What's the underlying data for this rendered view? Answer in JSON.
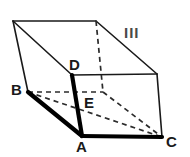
{
  "figure": {
    "kind": "geometry-diagram",
    "shape_name": "oblique prism",
    "region_label": "III",
    "stroke_color": "#1a1a1a",
    "thick_stroke_color": "#000000",
    "dashed_stroke_color": "#2b2b2b",
    "background_color": "#ffffff",
    "vertex_labels": [
      {
        "name": "label-B",
        "text": "B",
        "x": 11,
        "y": 82
      },
      {
        "name": "label-D",
        "text": "D",
        "x": 69,
        "y": 57
      },
      {
        "name": "label-E",
        "text": "E",
        "x": 84,
        "y": 95
      },
      {
        "name": "label-A",
        "text": "A",
        "x": 76,
        "y": 139
      },
      {
        "name": "label-C",
        "text": "C",
        "x": 166,
        "y": 134
      }
    ],
    "region_label_pos": {
      "x": 124,
      "y": 25
    },
    "points": {
      "top_back_left": {
        "x": 13,
        "y": 21
      },
      "top_back_right": {
        "x": 96,
        "y": 21
      },
      "top_front_right": {
        "x": 157,
        "y": 74
      },
      "D": {
        "x": 72,
        "y": 75
      },
      "B": {
        "x": 28,
        "y": 92
      },
      "E": {
        "x": 103,
        "y": 92
      },
      "A": {
        "x": 82,
        "y": 136
      },
      "C": {
        "x": 162,
        "y": 137
      }
    },
    "solid_edges": [
      {
        "name": "edge-topback-top",
        "from": "top_back_left",
        "to": "top_back_right"
      },
      {
        "name": "edge-topbackright-topfrontright",
        "from": "top_back_right",
        "to": "top_front_right"
      },
      {
        "name": "edge-topbackleft-D",
        "from": "top_back_left",
        "to": "D"
      },
      {
        "name": "edge-topbackleft-B",
        "from": "top_back_left",
        "to": "B"
      },
      {
        "name": "edge-D-topfrontright",
        "from": "D",
        "to": "top_front_right"
      },
      {
        "name": "edge-topfrontright-C",
        "from": "top_front_right",
        "to": "C"
      }
    ],
    "thick_edges": [
      {
        "name": "edge-B-A",
        "from": "B",
        "to": "A"
      },
      {
        "name": "edge-D-A",
        "from": "D",
        "to": "A"
      },
      {
        "name": "edge-A-C",
        "from": "A",
        "to": "C"
      }
    ],
    "dashed_edges": [
      {
        "name": "edge-B-E-hidden",
        "from": "B",
        "to": "E"
      },
      {
        "name": "edge-topbackright-E-hidden",
        "from": "top_back_right",
        "to": "E"
      },
      {
        "name": "edge-B-C-hidden",
        "from": "B",
        "to": "C"
      },
      {
        "name": "edge-E-C-hidden",
        "from": "E",
        "to": "C"
      }
    ]
  }
}
